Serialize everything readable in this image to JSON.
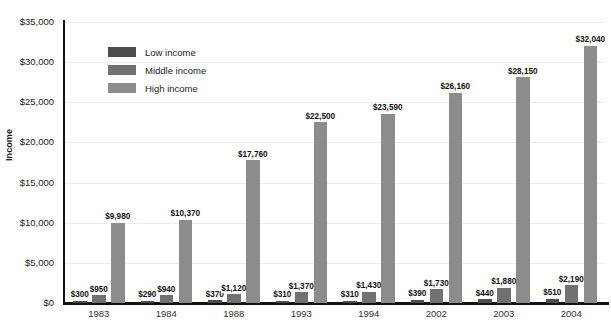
{
  "chart_data": {
    "type": "bar",
    "title": "",
    "subtitle": "",
    "xlabel": "",
    "ylabel": "Income",
    "ylim": [
      0,
      35000
    ],
    "ytick_values": [
      0,
      5000,
      10000,
      15000,
      20000,
      25000,
      30000,
      35000
    ],
    "ytick_labels": [
      "$0",
      "$5,000",
      "$10,000",
      "$15,000",
      "$20,000",
      "$25,000",
      "$30,000",
      "$35,000"
    ],
    "grid": true,
    "legend_position": "upper-left-inside",
    "categories": [
      "1983",
      "1984",
      "1988",
      "1993",
      "1994",
      "2002",
      "2003",
      "2004"
    ],
    "series": [
      {
        "name": "Low income",
        "color": "#4d4d4d",
        "values": [
          300,
          290,
          370,
          310,
          310,
          390,
          440,
          510
        ],
        "labels": [
          "$300",
          "$290",
          "$370",
          "$310",
          "$310",
          "$390",
          "$440",
          "$510"
        ]
      },
      {
        "name": "Middle income",
        "color": "#717171",
        "values": [
          950,
          940,
          1120,
          1370,
          1430,
          1730,
          1880,
          2190
        ],
        "labels": [
          "$950",
          "$940",
          "$1,120",
          "$1,370",
          "$1,430",
          "$1,730",
          "$1,880",
          "$2,190"
        ]
      },
      {
        "name": "High income",
        "color": "#8c8c8c",
        "values": [
          9980,
          10370,
          17760,
          22500,
          23590,
          26160,
          28150,
          32040
        ],
        "labels": [
          "$9,980",
          "$10,370",
          "$17,760",
          "$22,500",
          "$23,590",
          "$26,160",
          "$28,150",
          "$32,040"
        ]
      }
    ]
  },
  "axis": {
    "y_title": "Income"
  },
  "legend": {
    "items": [
      {
        "label": "Low income",
        "color": "#4d4d4d"
      },
      {
        "label": "Middle income",
        "color": "#717171"
      },
      {
        "label": "High income",
        "color": "#8c8c8c"
      }
    ]
  }
}
